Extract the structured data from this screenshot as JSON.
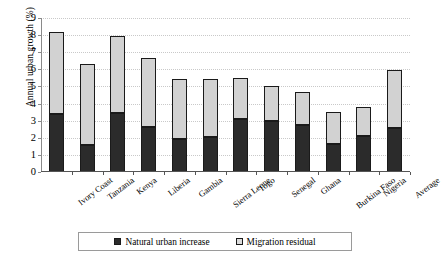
{
  "chart_data": {
    "type": "bar",
    "stacked": true,
    "title": "",
    "xlabel": "",
    "ylabel": "Annual urban growth (%)",
    "ylim": [
      0,
      9
    ],
    "yticks": [
      0,
      1,
      2,
      3,
      4,
      5,
      6,
      7,
      8,
      9
    ],
    "grid": true,
    "grid_style": "dotted-horizontal",
    "legend_position": "bottom-center",
    "categories": [
      "Ivory Coast",
      "Tanzania",
      "Kenya",
      "Liberia",
      "Gambia",
      "Sierra Leone",
      "Togo",
      "Senegal",
      "Ghana",
      "Burkina Faso",
      "Nigeria",
      "Average"
    ],
    "series": [
      {
        "name": "Natural urban increase",
        "color": "#2b2b2b",
        "values": [
          3.4,
          1.55,
          3.45,
          2.65,
          1.95,
          2.05,
          3.1,
          3.0,
          2.75,
          1.65,
          2.1,
          2.55
        ]
      },
      {
        "name": "Migration residual",
        "color": "#d2d2d2",
        "values": [
          4.8,
          4.75,
          4.5,
          4.0,
          3.5,
          3.4,
          2.4,
          2.0,
          1.95,
          1.85,
          1.7,
          3.4
        ]
      }
    ],
    "totals": [
      8.2,
      6.3,
      7.95,
      6.65,
      5.45,
      5.45,
      5.5,
      5.0,
      4.7,
      3.5,
      3.8,
      5.95
    ]
  },
  "legend": {
    "entries": [
      {
        "label": "Natural urban increase",
        "swatch": "natural"
      },
      {
        "label": "Migration residual",
        "swatch": "migration"
      }
    ]
  },
  "colors": {
    "natural": "#2b2b2b",
    "migration": "#d2d2d2",
    "axis": "#555555",
    "gridline": "#c9c9c9",
    "background": "#ffffff"
  }
}
